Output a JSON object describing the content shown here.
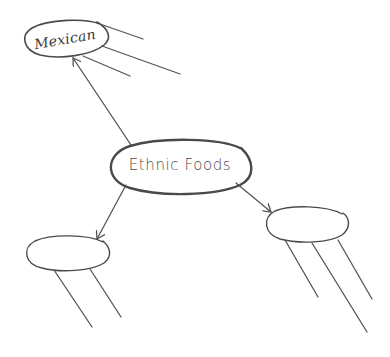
{
  "diagram": {
    "type": "mind-map",
    "stroke_color": "#4a4a4a",
    "background": "#ffffff",
    "center_node": {
      "label": "Ethnic Foods",
      "cx": 179,
      "cy": 168,
      "rx": 71,
      "ry": 25
    },
    "child_nodes": [
      {
        "id": "mexican",
        "label": "Mexican",
        "cx": 66,
        "cy": 39,
        "rx": 42,
        "ry": 17,
        "rotate": -10,
        "branch_lines": 3
      },
      {
        "id": "bottom-left",
        "label": "",
        "cx": 67,
        "cy": 253,
        "rx": 42,
        "ry": 17,
        "rotate": 0,
        "branch_lines": 2
      },
      {
        "id": "bottom-right",
        "label": "",
        "cx": 306,
        "cy": 224,
        "rx": 42,
        "ry": 17,
        "rotate": 0,
        "branch_lines": 3
      }
    ],
    "edges": [
      {
        "from": "Ethnic Foods",
        "to": "Mexican",
        "arrow": true
      },
      {
        "from": "Ethnic Foods",
        "to": "bottom-left",
        "arrow": true
      },
      {
        "from": "Ethnic Foods",
        "to": "bottom-right",
        "arrow": true
      }
    ]
  }
}
